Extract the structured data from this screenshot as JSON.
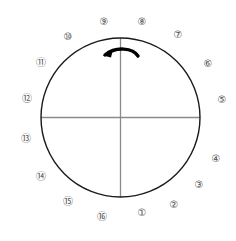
{
  "diagram": {
    "type": "circular-position-dial",
    "background_color": "#ffffff",
    "stroke_color": "#1a1a1a",
    "axis_color": "#8a8a8a",
    "label_color": "#4a4a4a",
    "circle": {
      "center_x": 120.5,
      "center_y": 117.5,
      "radius": 79.5,
      "stroke_width": 1.4
    },
    "axes": {
      "vertical_label": "vertical-axis",
      "horizontal_label": "horizontal-axis",
      "stroke_width": 1.3
    },
    "arrow": {
      "name": "counterclockwise-rotation-arrow",
      "direction": "counterclockwise",
      "color": "#000000",
      "path": "M 137 54 C 130 47 114 47 104 55",
      "head_points": "104,55 112,52 110,58"
    },
    "labels": [
      {
        "text": "①",
        "name": "position-label-1",
        "x": 142,
        "y": 214
      },
      {
        "text": "②",
        "name": "position-label-2",
        "x": 174,
        "y": 206
      },
      {
        "text": "③",
        "name": "position-label-3",
        "x": 199,
        "y": 186
      },
      {
        "text": "④",
        "name": "position-label-4",
        "x": 216,
        "y": 160
      },
      {
        "text": "⑤",
        "name": "position-label-5",
        "x": 222,
        "y": 101
      },
      {
        "text": "⑥",
        "name": "position-label-6",
        "x": 208,
        "y": 65
      },
      {
        "text": "⑦",
        "name": "position-label-7",
        "x": 178,
        "y": 36
      },
      {
        "text": "⑧",
        "name": "position-label-8",
        "x": 142,
        "y": 23
      },
      {
        "text": "⑨",
        "name": "position-label-9",
        "x": 104,
        "y": 23
      },
      {
        "text": "⑩",
        "name": "position-label-10",
        "x": 68,
        "y": 38
      },
      {
        "text": "⑪",
        "name": "position-label-11",
        "x": 41,
        "y": 64
      },
      {
        "text": "⑫",
        "name": "position-label-12",
        "x": 27,
        "y": 100
      },
      {
        "text": "⑬",
        "name": "position-label-13",
        "x": 26,
        "y": 140
      },
      {
        "text": "⑭",
        "name": "position-label-14",
        "x": 41,
        "y": 178
      },
      {
        "text": "⑮",
        "name": "position-label-15",
        "x": 68,
        "y": 203
      },
      {
        "text": "⑯",
        "name": "position-label-16",
        "x": 102,
        "y": 218
      }
    ]
  }
}
